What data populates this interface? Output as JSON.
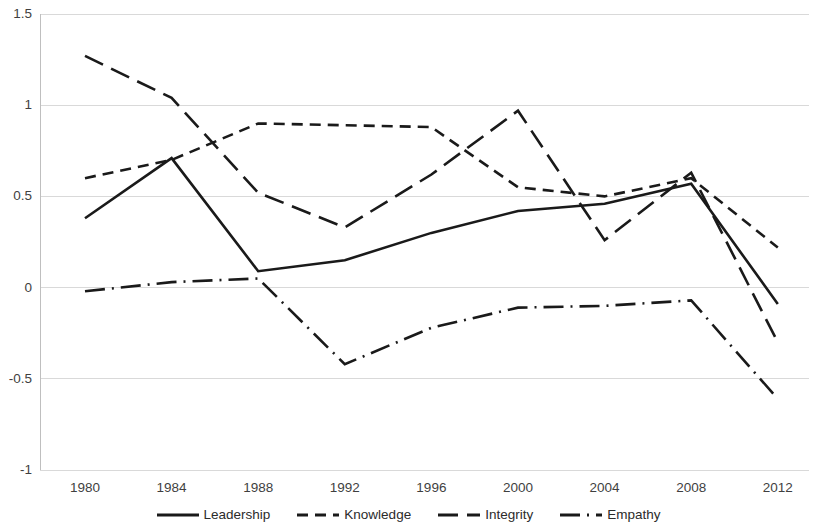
{
  "chart_data": {
    "type": "line",
    "title": "",
    "xlabel": "",
    "ylabel": "",
    "x": [
      1980,
      1984,
      1988,
      1992,
      1996,
      2000,
      2004,
      2008,
      2012
    ],
    "categories": [
      "1980",
      "1984",
      "1988",
      "1992",
      "1996",
      "2000",
      "2004",
      "2008",
      "2012"
    ],
    "xlim": [
      1980,
      2012
    ],
    "ylim": [
      -1,
      1.5
    ],
    "y_ticks": [
      "1.5",
      "1",
      "0.5",
      "0",
      "-0.5",
      "-1"
    ],
    "y_tick_values": [
      1.5,
      1,
      0.5,
      0,
      -0.5,
      -1
    ],
    "grid": "horizontal",
    "legend_position": "bottom",
    "series": [
      {
        "name": "Leadership",
        "style": "solid",
        "color": "#1a1a1a",
        "values": [
          0.38,
          0.71,
          0.09,
          0.15,
          0.3,
          0.42,
          0.46,
          0.57,
          -0.09
        ]
      },
      {
        "name": "Knowledge",
        "style": "dashed",
        "color": "#1a1a1a",
        "values": [
          0.6,
          0.7,
          0.9,
          0.89,
          0.88,
          0.55,
          0.5,
          0.6,
          0.22
        ]
      },
      {
        "name": "Integrity",
        "style": "long-dash",
        "color": "#1a1a1a",
        "values": [
          1.27,
          1.04,
          0.52,
          0.33,
          0.62,
          0.97,
          0.26,
          0.63,
          -0.3
        ]
      },
      {
        "name": "Empathy",
        "style": "dash-dot",
        "color": "#1a1a1a",
        "values": [
          -0.02,
          0.03,
          0.05,
          -0.42,
          -0.22,
          -0.11,
          -0.1,
          -0.07,
          -0.61
        ]
      }
    ]
  },
  "legend": {
    "items": [
      {
        "label": "Leadership",
        "marker": "solid-line-swatch"
      },
      {
        "label": "Knowledge",
        "marker": "dashed-line-swatch"
      },
      {
        "label": "Integrity",
        "marker": "dash-dot-line-swatch"
      },
      {
        "label": "Empathy",
        "marker": "dash-dot-line-swatch"
      }
    ]
  },
  "axes": {
    "y_color": "#bfbfbf",
    "grid_color": "#d9d9d9",
    "tick_text_color": "#3f3f3f"
  }
}
